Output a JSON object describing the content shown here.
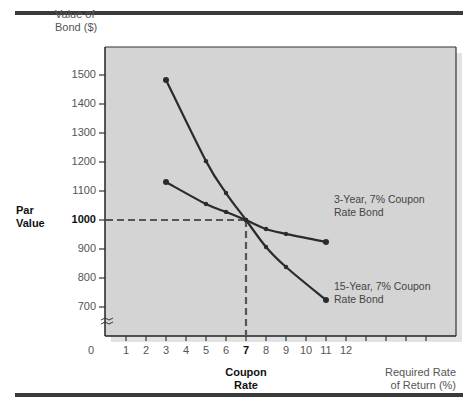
{
  "chart_data": {
    "type": "line",
    "title": "",
    "ylabel": "Value of Bond ($)",
    "xlabel": "Required Rate of Return (%)",
    "x_annotation": "Coupon Rate",
    "y_annotation": "Par Value",
    "x_ticks": [
      "1",
      "2",
      "3",
      "4",
      "5",
      "6",
      "7",
      "8",
      "9",
      "10",
      "11",
      "12"
    ],
    "x_extra_unlabeled_ticks": 4,
    "x_origin_label": "0",
    "y_ticks": [
      "700",
      "800",
      "900",
      "1000",
      "1100",
      "1200",
      "1300",
      "1400",
      "1500"
    ],
    "ylim": [
      650,
      1600
    ],
    "xlim": [
      0,
      17
    ],
    "grid": false,
    "axis_break": true,
    "reference_lines": {
      "x": 7,
      "y": 1000,
      "style": "dashed"
    },
    "series": [
      {
        "name": "3-Year, 7% Coupon Rate Bond",
        "x": [
          3,
          5,
          6,
          7,
          8,
          9,
          11
        ],
        "values": [
          1131,
          1055,
          1028,
          1000,
          969,
          952,
          924
        ]
      },
      {
        "name": "15-Year, 7% Coupon Rate Bond",
        "x": [
          3,
          5,
          6,
          7,
          8,
          9,
          11
        ],
        "values": [
          1483,
          1203,
          1093,
          1000,
          907,
          838,
          724
        ]
      }
    ],
    "colors": {
      "plot_bg": "#d4d4d4",
      "line": "#2b2b2b",
      "dash": "#555555",
      "frame_bar": "#3a3a3a"
    }
  },
  "labels": {
    "ytitle_line1": "Value of",
    "ytitle_line2": "Bond ($)",
    "par_line1": "Par",
    "par_line2": "Value",
    "coupon_line1": "Coupon",
    "coupon_line2": "Rate",
    "xtitle_line1": "Required Rate",
    "xtitle_line2": "of Return (%)",
    "legend_3yr_line1": "3-Year, 7% Coupon",
    "legend_3yr_line2": "Rate Bond",
    "legend_15yr_line1": "15-Year, 7% Coupon",
    "legend_15yr_line2": "Rate Bond",
    "zero": "0"
  }
}
